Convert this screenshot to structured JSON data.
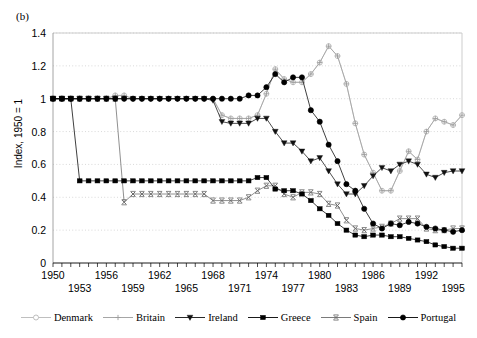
{
  "panel": {
    "label": "(b)"
  },
  "axes": {
    "ylabel": "Index, 1950 = 1",
    "yticks": [
      "0",
      "0.2",
      "0.4",
      "0.6",
      "0.8",
      "1",
      "1.2",
      "1.4"
    ],
    "xticks_upper": [
      "1950",
      "1956",
      "1962",
      "1968",
      "1974",
      "1980",
      "1986",
      "1992"
    ],
    "xticks_lower": [
      "1953",
      "1959",
      "1965",
      "1971",
      "1977",
      "1983",
      "1989",
      "1995"
    ]
  },
  "legend": {
    "items": [
      {
        "label": "Denmark",
        "marker": "open-circle",
        "color": "#b8b8b8"
      },
      {
        "label": "Britain",
        "marker": "plus",
        "color": "#9c9c9c"
      },
      {
        "label": "Ireland",
        "marker": "triangle-down",
        "color": "#111111"
      },
      {
        "label": "Greece",
        "marker": "square",
        "color": "#000000"
      },
      {
        "label": "Spain",
        "marker": "x-mark",
        "color": "#6b6b6b"
      },
      {
        "label": "Portugal",
        "marker": "filled-circle",
        "color": "#000000"
      }
    ]
  },
  "chart_data": {
    "type": "line",
    "title": "",
    "xlabel": "",
    "ylabel": "Index, 1950 = 1",
    "xlim": [
      1950,
      1996
    ],
    "ylim": [
      0,
      1.4
    ],
    "grid": true,
    "legend_position": "bottom",
    "x": [
      1950,
      1951,
      1952,
      1953,
      1954,
      1955,
      1956,
      1957,
      1958,
      1959,
      1960,
      1961,
      1962,
      1963,
      1964,
      1965,
      1966,
      1967,
      1968,
      1969,
      1970,
      1971,
      1972,
      1973,
      1974,
      1975,
      1976,
      1977,
      1978,
      1979,
      1980,
      1981,
      1982,
      1983,
      1984,
      1985,
      1986,
      1987,
      1988,
      1989,
      1990,
      1991,
      1992,
      1993,
      1994,
      1995,
      1996
    ],
    "series": [
      {
        "name": "Denmark",
        "marker": "open-circle",
        "color": "#b8b8b8",
        "values": [
          1.0,
          1.0,
          1.0,
          1.0,
          1.0,
          1.0,
          1.0,
          1.02,
          1.02,
          1.0,
          1.0,
          1.0,
          1.0,
          1.0,
          1.0,
          1.0,
          1.0,
          1.0,
          1.0,
          0.9,
          0.88,
          0.88,
          0.88,
          0.9,
          1.03,
          1.18,
          1.12,
          1.1,
          1.1,
          1.15,
          1.22,
          1.32,
          1.26,
          1.09,
          0.85,
          0.66,
          0.55,
          0.44,
          0.44,
          0.56,
          0.68,
          0.63,
          0.8,
          0.88,
          0.86,
          0.84,
          0.9
        ]
      },
      {
        "name": "Britain",
        "marker": "plus",
        "color": "#9c9c9c",
        "values": [
          1.0,
          1.0,
          1.0,
          1.0,
          1.0,
          1.0,
          1.0,
          1.02,
          1.02,
          1.0,
          1.0,
          1.0,
          1.0,
          1.0,
          1.0,
          1.0,
          1.0,
          1.0,
          1.0,
          0.9,
          0.88,
          0.88,
          0.88,
          0.9,
          1.03,
          1.18,
          1.12,
          1.1,
          1.1,
          1.15,
          1.22,
          1.32,
          1.26,
          1.09,
          0.85,
          0.66,
          0.55,
          0.44,
          0.44,
          0.56,
          0.68,
          0.63,
          0.8,
          0.88,
          0.86,
          0.84,
          0.9
        ]
      },
      {
        "name": "Ireland",
        "marker": "triangle-down",
        "color": "#111111",
        "values": [
          1.0,
          1.0,
          1.0,
          1.0,
          1.0,
          1.0,
          1.0,
          1.0,
          1.0,
          1.0,
          1.0,
          1.0,
          1.0,
          1.0,
          1.0,
          1.0,
          1.0,
          1.0,
          0.99,
          0.86,
          0.85,
          0.85,
          0.85,
          0.88,
          0.88,
          0.8,
          0.73,
          0.73,
          0.68,
          0.62,
          0.64,
          0.56,
          0.48,
          0.42,
          0.42,
          0.47,
          0.53,
          0.58,
          0.56,
          0.6,
          0.62,
          0.6,
          0.54,
          0.52,
          0.55,
          0.56,
          0.56
        ]
      },
      {
        "name": "Greece",
        "marker": "square",
        "color": "#000000",
        "values": [
          1.0,
          1.0,
          1.0,
          0.5,
          0.5,
          0.5,
          0.5,
          0.5,
          0.5,
          0.5,
          0.5,
          0.5,
          0.5,
          0.5,
          0.5,
          0.5,
          0.5,
          0.5,
          0.5,
          0.5,
          0.5,
          0.5,
          0.5,
          0.52,
          0.52,
          0.45,
          0.44,
          0.44,
          0.42,
          0.38,
          0.33,
          0.29,
          0.24,
          0.2,
          0.17,
          0.16,
          0.17,
          0.17,
          0.16,
          0.16,
          0.15,
          0.14,
          0.13,
          0.11,
          0.1,
          0.09,
          0.09
        ]
      },
      {
        "name": "Spain",
        "marker": "x-mark",
        "color": "#6b6b6b",
        "values": [
          1.0,
          1.0,
          1.0,
          1.0,
          1.0,
          1.0,
          1.0,
          1.0,
          0.37,
          0.42,
          0.42,
          0.42,
          0.42,
          0.42,
          0.42,
          0.42,
          0.42,
          0.42,
          0.38,
          0.38,
          0.38,
          0.38,
          0.4,
          0.44,
          0.47,
          0.47,
          0.42,
          0.4,
          0.43,
          0.43,
          0.42,
          0.36,
          0.35,
          0.26,
          0.21,
          0.2,
          0.21,
          0.22,
          0.24,
          0.27,
          0.27,
          0.27,
          0.21,
          0.2,
          0.2,
          0.21,
          0.21
        ]
      },
      {
        "name": "Portugal",
        "marker": "filled-circle",
        "color": "#000000",
        "values": [
          1.0,
          1.0,
          1.0,
          1.0,
          1.0,
          1.0,
          1.0,
          1.0,
          1.0,
          1.0,
          1.0,
          1.0,
          1.0,
          1.0,
          1.0,
          1.0,
          1.0,
          1.0,
          1.0,
          1.0,
          1.0,
          1.0,
          1.02,
          1.02,
          1.07,
          1.15,
          1.1,
          1.13,
          1.13,
          0.93,
          0.86,
          0.72,
          0.62,
          0.48,
          0.44,
          0.33,
          0.24,
          0.21,
          0.24,
          0.23,
          0.25,
          0.24,
          0.22,
          0.21,
          0.2,
          0.19,
          0.2
        ]
      }
    ]
  }
}
